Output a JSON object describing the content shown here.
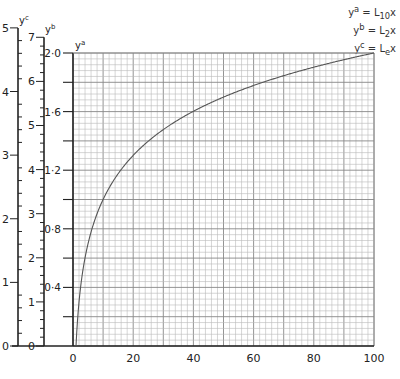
{
  "chart_data": {
    "type": "line",
    "title": "",
    "xlabel": "",
    "ylabel": "",
    "x": [
      1,
      2,
      5,
      10,
      20,
      30,
      40,
      50,
      60,
      70,
      80,
      90,
      100
    ],
    "series": [
      {
        "name": "y^a = L10 x",
        "axis": "y^a",
        "values": [
          0.0,
          0.301,
          0.699,
          1.0,
          1.301,
          1.477,
          1.602,
          1.699,
          1.778,
          1.845,
          1.903,
          1.954,
          2.0
        ]
      }
    ],
    "xlim": [
      0,
      100
    ],
    "x_ticks": [
      "0",
      "20",
      "40",
      "60",
      "80",
      "100"
    ],
    "axes": [
      {
        "name": "y^c",
        "label": "y",
        "sup": "c",
        "range": [
          0,
          5
        ],
        "ticks": [
          "0",
          "1",
          "2",
          "3",
          "4",
          "5"
        ],
        "minor_step": 0.2,
        "meaning": "natural log (L_e x)"
      },
      {
        "name": "y^b",
        "label": "y",
        "sup": "b",
        "range": [
          0,
          7
        ],
        "ticks": [
          "0",
          "1",
          "2",
          "3",
          "4",
          "5",
          "6",
          "7"
        ],
        "minor_step": 0.2,
        "meaning": "log base 2 (L_2 x)"
      },
      {
        "name": "y^a",
        "label": "y",
        "sup": "a",
        "range": [
          0,
          2.0
        ],
        "ticks": [
          "0·4",
          "0·8",
          "1·2",
          "1·6",
          "2·0"
        ],
        "tick_values": [
          0.4,
          0.8,
          1.2,
          1.6,
          2.0
        ],
        "minor_step": 0.2,
        "meaning": "log base 10 (L_10 x)"
      }
    ],
    "grid": true,
    "grid_minor": {
      "x_step": 2,
      "y_step": 0.04
    },
    "grid_major": {
      "x_step": 10,
      "y_step": 0.2
    },
    "legend_position": "top-right",
    "legend": [
      {
        "lhs": "y",
        "sup": "a",
        "eq": " = L",
        "sub": "10",
        "var": "x"
      },
      {
        "lhs": "y",
        "sup": "b",
        "eq": " = L",
        "sub": "2",
        "var": "x"
      },
      {
        "lhs": "y",
        "sup": "c",
        "eq": " = L",
        "sub": "e",
        "var": "x"
      }
    ]
  }
}
